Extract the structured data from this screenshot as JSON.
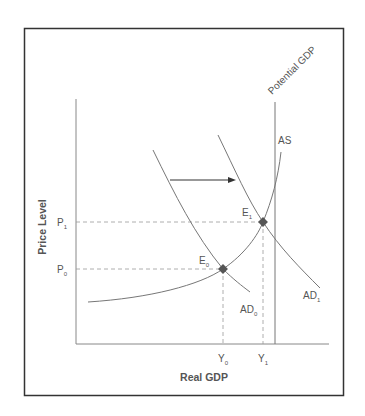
{
  "diagram": {
    "type": "AD-AS economics diagram",
    "axes": {
      "x_label": "Real GDP",
      "y_label": "Price Level"
    },
    "curves": {
      "potential_gdp": {
        "label": "Potential GDP"
      },
      "as": {
        "label": "AS"
      },
      "ad0": {
        "label": "AD",
        "subscript": "0"
      },
      "ad1": {
        "label": "AD",
        "subscript": "1"
      }
    },
    "equilibria": [
      {
        "label": "E",
        "subscript": "0",
        "price": "P",
        "price_sub": "0",
        "output": "Y",
        "output_sub": "0"
      },
      {
        "label": "E",
        "subscript": "1",
        "price": "P",
        "price_sub": "1",
        "output": "Y",
        "output_sub": "1"
      }
    ],
    "shift_arrow": {
      "direction": "right",
      "meaning": "AD0 shifts to AD1"
    },
    "colors": {
      "frame": "#333333",
      "curve": "#777777",
      "dashed": "#999999",
      "point": "#555555",
      "arrow": "#333333"
    }
  }
}
